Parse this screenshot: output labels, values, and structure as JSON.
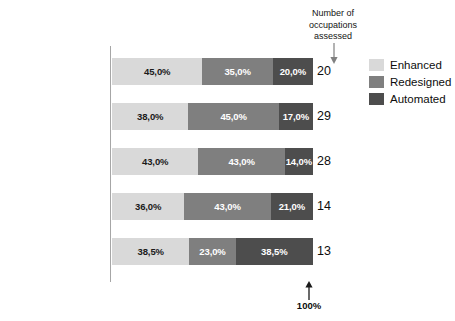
{
  "chart_data": {
    "type": "bar",
    "subtype": "stacked-horizontal-100pct",
    "title": "",
    "xlabel": "",
    "ylabel": "",
    "xlim": [
      0,
      100
    ],
    "grid": false,
    "legend_position": "right",
    "categories": [
      "Exploration",
      "Mining Operations",
      "Processing",
      "Transport",
      "Trading"
    ],
    "series": [
      {
        "name": "Enhanced",
        "color": "#d9d9d9",
        "values": [
          45.0,
          38.0,
          43.0,
          36.0,
          38.5
        ]
      },
      {
        "name": "Redesigned",
        "color": "#7f7f7f",
        "values": [
          35.0,
          45.0,
          43.0,
          43.0,
          23.0
        ]
      },
      {
        "name": "Automated",
        "color": "#4d4d4d",
        "values": [
          20.0,
          17.0,
          14.0,
          21.0,
          38.5
        ]
      }
    ],
    "data_labels": [
      [
        "45,0%",
        "35,0%",
        "20,0%"
      ],
      [
        "38,0%",
        "45,0%",
        "17,0%"
      ],
      [
        "43,0%",
        "43,0%",
        "14,0%"
      ],
      [
        "36,0%",
        "43,0%",
        "21,0%"
      ],
      [
        "38,5%",
        "23,0%",
        "38,5%"
      ]
    ],
    "counts": [
      "20",
      "29",
      "28",
      "14",
      "13"
    ],
    "annotations": [
      {
        "name": "top",
        "text": "Number of occupations assessed",
        "points_to": "counts-column"
      },
      {
        "name": "bottom",
        "text": "100%",
        "points_to": "bar-end"
      }
    ]
  },
  "rows": [
    {
      "label": "Exploration",
      "count": "20",
      "segments": [
        {
          "series": "Enhanced",
          "value": 45.0,
          "label": "45,0%"
        },
        {
          "series": "Redesigned",
          "value": 35.0,
          "label": "35,0%"
        },
        {
          "series": "Automated",
          "value": 20.0,
          "label": "20,0%"
        }
      ]
    },
    {
      "label": "Mining Operations",
      "count": "29",
      "segments": [
        {
          "series": "Enhanced",
          "value": 38.0,
          "label": "38,0%"
        },
        {
          "series": "Redesigned",
          "value": 45.0,
          "label": "45,0%"
        },
        {
          "series": "Automated",
          "value": 17.0,
          "label": "17,0%"
        }
      ]
    },
    {
      "label": "Processing",
      "count": "28",
      "segments": [
        {
          "series": "Enhanced",
          "value": 43.0,
          "label": "43,0%"
        },
        {
          "series": "Redesigned",
          "value": 43.0,
          "label": "43,0%"
        },
        {
          "series": "Automated",
          "value": 14.0,
          "label": "14,0%"
        }
      ]
    },
    {
      "label": "Transport",
      "count": "14",
      "segments": [
        {
          "series": "Enhanced",
          "value": 36.0,
          "label": "36,0%"
        },
        {
          "series": "Redesigned",
          "value": 43.0,
          "label": "43,0%"
        },
        {
          "series": "Automated",
          "value": 21.0,
          "label": "21,0%"
        }
      ]
    },
    {
      "label": "Trading",
      "count": "13",
      "segments": [
        {
          "series": "Enhanced",
          "value": 38.5,
          "label": "38,5%"
        },
        {
          "series": "Redesigned",
          "value": 23.0,
          "label": "23,0%"
        },
        {
          "series": "Automated",
          "value": 38.5,
          "label": "38,5%"
        }
      ]
    }
  ],
  "legend": {
    "items": [
      {
        "label": "Enhanced",
        "color": "#d9d9d9"
      },
      {
        "label": "Redesigned",
        "color": "#7f7f7f"
      },
      {
        "label": "Automated",
        "color": "#4d4d4d"
      }
    ]
  },
  "annotations": {
    "top_note": "Number of occupations assessed",
    "bottom_note": "100%"
  }
}
